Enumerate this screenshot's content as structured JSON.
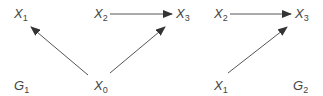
{
  "graphs": [
    {
      "name": "G1",
      "label": {
        "main": "G",
        "sub": "1"
      },
      "nodes": [
        {
          "id": "X1",
          "main": "X",
          "sub": "1"
        },
        {
          "id": "X2",
          "main": "X",
          "sub": "2"
        },
        {
          "id": "X3",
          "main": "X",
          "sub": "3"
        },
        {
          "id": "X0",
          "main": "X",
          "sub": "0"
        }
      ],
      "edges": [
        [
          "X0",
          "X1"
        ],
        [
          "X0",
          "X3"
        ],
        [
          "X2",
          "X3"
        ]
      ]
    },
    {
      "name": "G2",
      "label": {
        "main": "G",
        "sub": "2"
      },
      "nodes": [
        {
          "id": "X2",
          "main": "X",
          "sub": "2"
        },
        {
          "id": "X3",
          "main": "X",
          "sub": "3"
        },
        {
          "id": "X1",
          "main": "X",
          "sub": "1"
        }
      ],
      "edges": [
        [
          "X2",
          "X3"
        ],
        [
          "X1",
          "X3"
        ]
      ]
    }
  ],
  "colors": {
    "line": "#444444",
    "text": "#444444"
  }
}
